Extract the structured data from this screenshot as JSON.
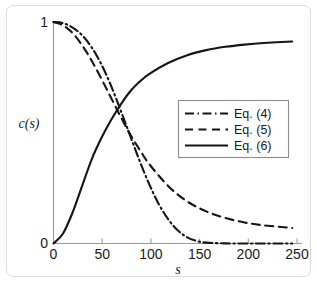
{
  "figure": {
    "frame_border_color": "#dcdcdc",
    "background_color": "#ffffff",
    "curve_color": "#151515",
    "axis_color": "#9a9a9a"
  },
  "chart_data": {
    "type": "line",
    "title": "",
    "xlabel": "s",
    "ylabel": "c(s)",
    "xlim": [
      0,
      255
    ],
    "ylim": [
      0,
      1
    ],
    "xticks": [
      0,
      50,
      100,
      150,
      200,
      250
    ],
    "xticklabels": [
      "0",
      "50",
      "100",
      "150",
      "200",
      "250"
    ],
    "yticks": [
      0,
      1
    ],
    "yticklabels": [
      "0",
      "1"
    ],
    "grid": false,
    "legend_position": "center-right",
    "series": [
      {
        "name": "Eq. (4)",
        "style": "dash-dot",
        "x": [
          0,
          10,
          20,
          30,
          40,
          50,
          60,
          70,
          80,
          90,
          100,
          110,
          120,
          130,
          140,
          150,
          160,
          180,
          200,
          220,
          250
        ],
        "values": [
          1.0,
          0.995,
          0.975,
          0.94,
          0.885,
          0.81,
          0.715,
          0.605,
          0.49,
          0.375,
          0.27,
          0.18,
          0.11,
          0.06,
          0.028,
          0.011,
          0.004,
          0.0005,
          0.0,
          0.0,
          0.0
        ]
      },
      {
        "name": "Eq. (5)",
        "style": "dashed",
        "x": [
          0,
          10,
          20,
          30,
          40,
          50,
          60,
          70,
          80,
          90,
          100,
          120,
          140,
          160,
          180,
          200,
          220,
          250
        ],
        "values": [
          1.0,
          0.985,
          0.95,
          0.895,
          0.825,
          0.745,
          0.66,
          0.575,
          0.495,
          0.425,
          0.36,
          0.26,
          0.19,
          0.145,
          0.115,
          0.095,
          0.082,
          0.07
        ]
      },
      {
        "name": "Eq. (6)",
        "style": "solid",
        "x": [
          0,
          10,
          20,
          30,
          40,
          50,
          60,
          70,
          80,
          90,
          100,
          120,
          140,
          160,
          180,
          200,
          220,
          250
        ],
        "values": [
          0.0,
          0.045,
          0.14,
          0.26,
          0.38,
          0.475,
          0.555,
          0.625,
          0.685,
          0.73,
          0.765,
          0.815,
          0.85,
          0.873,
          0.888,
          0.898,
          0.905,
          0.912
        ]
      }
    ],
    "legend": [
      {
        "label": "Eq. (4)",
        "style": "dash-dot"
      },
      {
        "label": "Eq. (5)",
        "style": "dashed"
      },
      {
        "label": "Eq. (6)",
        "style": "solid"
      }
    ]
  },
  "caption": {
    "partial_text": ""
  }
}
